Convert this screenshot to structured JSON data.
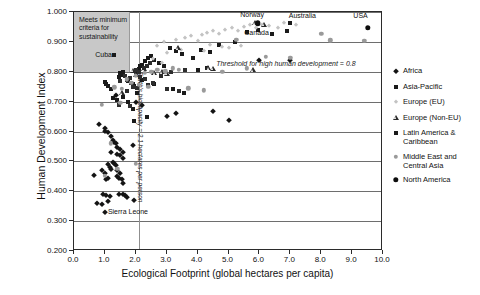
{
  "chart_data": {
    "type": "scatter",
    "title": "",
    "xlabel": "Ecological Footprint (global hectares per capita)",
    "ylabel": "Human Development Index",
    "xlim": [
      0.0,
      10.0
    ],
    "ylim": [
      0.2,
      1.0
    ],
    "xticks": [
      "0.0",
      "1.0",
      "2.0",
      "3.0",
      "4.0",
      "5.0",
      "6.0",
      "7.0",
      "8.0",
      "9.0",
      "10.0"
    ],
    "xtick_values": [
      0,
      1,
      2,
      3,
      4,
      5,
      6,
      7,
      8,
      9,
      10
    ],
    "yticks": [
      "0.200",
      "0.300",
      "0.400",
      "0.500",
      "0.600",
      "0.700",
      "0.800",
      "0.900",
      "1.000"
    ],
    "ytick_values": [
      0.2,
      0.3,
      0.4,
      0.5,
      0.6,
      0.7,
      0.8,
      0.9,
      1.0
    ],
    "grid": "horizontal",
    "legend_position": "right",
    "annotations": {
      "sustainability_box": {
        "text": "Meets minimum criteria for sustainability",
        "text_lines": [
          "Meets minimum",
          "criteria for",
          "sustainability"
        ],
        "x_range": [
          0.0,
          1.8
        ],
        "y_range": [
          0.8,
          1.0
        ],
        "fill": "#c8c8c8"
      },
      "biocapacity_line": {
        "text": "Earth's biocapacity = 2.1 hectares per person",
        "x_value": 2.1,
        "color": "#8f8f8f"
      },
      "threshold_label": {
        "text": "Threshold for high human development = 0.8",
        "y_value": 0.8
      },
      "point_labels": [
        {
          "text": "Norway",
          "x": 5.8,
          "y": 0.965
        },
        {
          "text": "Canada",
          "x": 5.9,
          "y": 0.94
        },
        {
          "text": "Australia",
          "x": 7.5,
          "y": 0.963
        },
        {
          "text": "USA",
          "x": 9.3,
          "y": 0.96
        },
        {
          "text": "Cuba",
          "x": 1.4,
          "y": 0.855
        },
        {
          "text": "Sierra Leone",
          "x": 1.0,
          "y": 0.33
        }
      ]
    },
    "series": [
      {
        "name": "Africa",
        "marker": "diamond",
        "color": "#141414",
        "points": [
          [
            0.8,
            0.625
          ],
          [
            1.0,
            0.612
          ],
          [
            1.0,
            0.603
          ],
          [
            1.1,
            0.598
          ],
          [
            1.2,
            0.585
          ],
          [
            1.25,
            0.572
          ],
          [
            1.3,
            0.565
          ],
          [
            1.35,
            0.56
          ],
          [
            1.4,
            0.548
          ],
          [
            1.5,
            0.54
          ],
          [
            1.6,
            0.532
          ],
          [
            1.9,
            0.556
          ],
          [
            1.2,
            0.53
          ],
          [
            1.4,
            0.524
          ],
          [
            1.5,
            0.52
          ],
          [
            1.6,
            0.512
          ],
          [
            0.65,
            0.456
          ],
          [
            0.9,
            0.47
          ],
          [
            1.0,
            0.462
          ],
          [
            1.1,
            0.49
          ],
          [
            1.15,
            0.48
          ],
          [
            1.2,
            0.475
          ],
          [
            1.25,
            0.497
          ],
          [
            1.3,
            0.493
          ],
          [
            1.35,
            0.487
          ],
          [
            1.4,
            0.47
          ],
          [
            1.4,
            0.452
          ],
          [
            1.45,
            0.445
          ],
          [
            1.5,
            0.462
          ],
          [
            1.55,
            0.44
          ],
          [
            1.6,
            0.426
          ],
          [
            1.1,
            0.446
          ],
          [
            1.05,
            0.44
          ],
          [
            0.95,
            0.392
          ],
          [
            1.05,
            0.388
          ],
          [
            1.15,
            0.384
          ],
          [
            1.45,
            0.392
          ],
          [
            1.6,
            0.39
          ],
          [
            1.65,
            0.386
          ],
          [
            1.7,
            0.382
          ],
          [
            1.95,
            0.372
          ],
          [
            0.75,
            0.362
          ],
          [
            0.9,
            0.358
          ],
          [
            1.1,
            0.368
          ],
          [
            1.0,
            0.33
          ],
          [
            2.0,
            0.7
          ],
          [
            2.2,
            0.688
          ],
          [
            1.35,
            0.722
          ],
          [
            3.0,
            0.652
          ],
          [
            3.3,
            0.662
          ],
          [
            4.5,
            0.668
          ],
          [
            5.0,
            0.637
          ],
          [
            6.0,
            0.841
          ],
          [
            7.0,
            0.84
          ]
        ]
      },
      {
        "name": "Asia-Pacific",
        "marker": "square",
        "color": "#1a1a1a",
        "points": [
          [
            1.0,
            0.765
          ],
          [
            1.05,
            0.758
          ],
          [
            1.1,
            0.752
          ],
          [
            1.2,
            0.742
          ],
          [
            1.45,
            0.782
          ],
          [
            1.5,
            0.796
          ],
          [
            1.55,
            0.79
          ],
          [
            1.6,
            0.8
          ],
          [
            1.7,
            0.772
          ],
          [
            1.75,
            0.768
          ],
          [
            1.85,
            0.762
          ],
          [
            1.9,
            0.758
          ],
          [
            1.95,
            0.752
          ],
          [
            2.0,
            0.797
          ],
          [
            2.05,
            0.802
          ],
          [
            2.1,
            0.81
          ],
          [
            2.15,
            0.818
          ],
          [
            2.2,
            0.824
          ],
          [
            2.3,
            0.836
          ],
          [
            2.4,
            0.845
          ],
          [
            2.5,
            0.852
          ],
          [
            2.6,
            0.84
          ],
          [
            2.75,
            0.828
          ],
          [
            2.9,
            0.82
          ],
          [
            1.3,
            0.856
          ],
          [
            1.25,
            0.712
          ],
          [
            1.4,
            0.705
          ],
          [
            1.6,
            0.716
          ],
          [
            1.75,
            0.698
          ],
          [
            1.9,
            0.676
          ],
          [
            2.05,
            0.73
          ],
          [
            3.1,
            0.878
          ],
          [
            3.3,
            0.868
          ],
          [
            3.5,
            0.858
          ],
          [
            3.85,
            0.846
          ],
          [
            4.1,
            0.874
          ],
          [
            4.4,
            0.866
          ],
          [
            4.7,
            0.89
          ],
          [
            5.2,
            0.9
          ],
          [
            5.6,
            0.932
          ],
          [
            5.95,
            0.94
          ],
          [
            6.4,
            0.925
          ],
          [
            4.0,
            0.806
          ],
          [
            4.3,
            0.812
          ],
          [
            3.2,
            0.742
          ],
          [
            3.55,
            0.728
          ],
          [
            2.6,
            0.76
          ],
          [
            2.2,
            0.772
          ],
          [
            7.0,
            0.963
          ],
          [
            6.9,
            0.938
          ],
          [
            1.95,
            0.636
          ],
          [
            2.35,
            0.648
          ]
        ]
      },
      {
        "name": "Europe (EU)",
        "marker": "diamond-light",
        "color": "#c3c3c3",
        "points": [
          [
            3.3,
            0.906
          ],
          [
            3.6,
            0.912
          ],
          [
            3.8,
            0.918
          ],
          [
            4.0,
            0.902
          ],
          [
            4.15,
            0.922
          ],
          [
            4.3,
            0.93
          ],
          [
            4.5,
            0.935
          ],
          [
            4.7,
            0.928
          ],
          [
            4.9,
            0.94
          ],
          [
            5.1,
            0.946
          ],
          [
            5.3,
            0.938
          ],
          [
            5.5,
            0.95
          ],
          [
            5.7,
            0.955
          ],
          [
            5.9,
            0.948
          ],
          [
            6.1,
            0.958
          ],
          [
            6.3,
            0.952
          ],
          [
            6.6,
            0.946
          ],
          [
            4.4,
            0.89
          ],
          [
            4.8,
            0.884
          ],
          [
            5.0,
            0.878
          ],
          [
            3.0,
            0.862
          ],
          [
            3.45,
            0.872
          ],
          [
            2.9,
            0.898
          ],
          [
            2.7,
            0.886
          ],
          [
            4.2,
            0.868
          ],
          [
            5.4,
            0.886
          ],
          [
            6.8,
            0.962
          ],
          [
            7.2,
            0.956
          ],
          [
            2.55,
            0.842
          ],
          [
            2.85,
            0.83
          ]
        ]
      },
      {
        "name": "Europe (Non-EU)",
        "marker": "triangle",
        "color": "#2b2b2b",
        "points": [
          [
            3.35,
            0.878
          ],
          [
            2.6,
            0.795
          ],
          [
            2.85,
            0.798
          ],
          [
            3.0,
            0.794
          ],
          [
            4.35,
            0.812
          ],
          [
            4.5,
            0.81
          ],
          [
            5.8,
            0.806
          ],
          [
            1.55,
            0.728
          ],
          [
            1.9,
            0.804
          ],
          [
            2.25,
            0.808
          ],
          [
            5.85,
            0.962
          ],
          [
            6.15,
            0.958
          ],
          [
            2.0,
            0.79
          ]
        ]
      },
      {
        "name": "Latin America & Caribbean",
        "marker": "square",
        "color": "#2d2d2d",
        "points": [
          [
            1.5,
            0.77
          ],
          [
            1.65,
            0.786
          ],
          [
            1.8,
            0.778
          ],
          [
            2.0,
            0.806
          ],
          [
            2.1,
            0.8
          ],
          [
            2.25,
            0.812
          ],
          [
            2.35,
            0.82
          ],
          [
            2.45,
            0.828
          ],
          [
            2.15,
            0.784
          ],
          [
            2.3,
            0.776
          ],
          [
            1.9,
            0.75
          ],
          [
            2.05,
            0.744
          ],
          [
            2.4,
            0.756
          ],
          [
            2.55,
            0.764
          ],
          [
            1.7,
            0.735
          ],
          [
            3.15,
            0.8
          ],
          [
            3.6,
            0.806
          ],
          [
            2.8,
            0.786
          ],
          [
            3.0,
            0.742
          ],
          [
            3.4,
            0.736
          ],
          [
            1.45,
            0.69
          ],
          [
            1.8,
            0.684
          ]
        ]
      },
      {
        "name": "Middle East and Central Asia",
        "marker": "circle",
        "color": "#9a9a9a",
        "points": [
          [
            0.9,
            0.69
          ],
          [
            1.5,
            0.697
          ],
          [
            1.7,
            0.775
          ],
          [
            2.0,
            0.786
          ],
          [
            2.3,
            0.796
          ],
          [
            2.5,
            0.8
          ],
          [
            2.7,
            0.806
          ],
          [
            2.95,
            0.802
          ],
          [
            3.2,
            0.812
          ],
          [
            3.4,
            0.806
          ],
          [
            1.85,
            0.762
          ],
          [
            2.1,
            0.756
          ],
          [
            2.4,
            0.75
          ],
          [
            1.3,
            0.748
          ],
          [
            1.55,
            0.742
          ],
          [
            3.7,
            0.744
          ],
          [
            4.2,
            0.738
          ],
          [
            4.8,
            0.8
          ],
          [
            5.6,
            0.812
          ],
          [
            6.2,
            0.85
          ],
          [
            5.25,
            0.906
          ],
          [
            7.0,
            0.846
          ],
          [
            8.0,
            0.928
          ],
          [
            8.3,
            0.905
          ],
          [
            9.4,
            0.903
          ],
          [
            1.2,
            0.56
          ],
          [
            1.0,
            0.452
          ],
          [
            1.4,
            0.475
          ],
          [
            2.0,
            0.492
          ]
        ]
      },
      {
        "name": "North America",
        "marker": "circle-filled",
        "color": "#0d0d0d",
        "points": [
          [
            5.95,
            0.962
          ],
          [
            9.5,
            0.948
          ]
        ]
      }
    ]
  },
  "legend": {
    "items": [
      {
        "label": "Africa",
        "marker": "diamond"
      },
      {
        "label": "Asia-Pacific",
        "marker": "square"
      },
      {
        "label": "Europe (EU)",
        "marker": "diamond-light"
      },
      {
        "label": "Europe (Non-EU)",
        "marker": "triangle"
      },
      {
        "label": "Latin America & Caribbean",
        "marker": "square"
      },
      {
        "label": "Middle East and Central Asia",
        "marker": "circle"
      },
      {
        "label": "North America",
        "marker": "circle-filled"
      }
    ]
  }
}
